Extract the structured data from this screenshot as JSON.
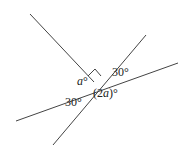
{
  "diagram": {
    "type": "intersecting-lines-angles",
    "lines": [
      {
        "id": "ray-upper-left",
        "x1": 30,
        "y1": 14,
        "x2": 94,
        "y2": 82
      },
      {
        "id": "line-steep",
        "x1": 146,
        "y1": 35,
        "x2": 53,
        "y2": 145
      },
      {
        "id": "line-shallow",
        "x1": 178,
        "y1": 63,
        "x2": 16,
        "y2": 121
      }
    ],
    "right_angle_marker": true,
    "labels": {
      "a": {
        "var": "a",
        "unit": "°"
      },
      "two_a": {
        "open": "(2",
        "var": "a",
        "close": ")°"
      },
      "thirty_top": "30°",
      "thirty_bottom": "30°"
    }
  }
}
